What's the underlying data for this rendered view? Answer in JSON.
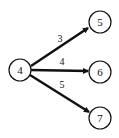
{
  "graph": {
    "nodes": [
      {
        "id": "4",
        "label": "4",
        "cx": 20,
        "cy": 70,
        "r": 11
      },
      {
        "id": "5",
        "label": "5",
        "cx": 100,
        "cy": 22,
        "r": 11
      },
      {
        "id": "6",
        "label": "6",
        "cx": 100,
        "cy": 72,
        "r": 11
      },
      {
        "id": "7",
        "label": "7",
        "cx": 100,
        "cy": 118,
        "r": 11
      }
    ],
    "edges": [
      {
        "from": "4",
        "to": "5",
        "weight": "3"
      },
      {
        "from": "4",
        "to": "6",
        "weight": "4"
      },
      {
        "from": "4",
        "to": "7",
        "weight": "5"
      }
    ]
  }
}
